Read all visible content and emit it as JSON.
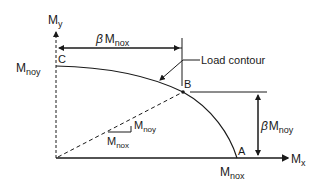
{
  "axes": {
    "y_label": "M",
    "y_sub": "y",
    "x_label": "M",
    "x_sub": "x"
  },
  "points": {
    "C": "C",
    "B": "B",
    "A": "A"
  },
  "labels": {
    "mnoy_left": "M",
    "mnoy_left_sub": "noy",
    "mnox_bottom": "M",
    "mnox_bottom_sub": "nox",
    "beta_mnox": "β",
    "beta_mnox_m": "M",
    "beta_mnox_sub": "nox",
    "beta_mnoy": "β",
    "beta_mnoy_m": "M",
    "beta_mnoy_sub": "noy",
    "load_contour": "Load contour",
    "slope_num": "M",
    "slope_num_sub": "noy",
    "slope_den": "M",
    "slope_den_sub": "nox"
  },
  "colors": {
    "ink": "#1a1a1a",
    "background": "#ffffff"
  }
}
